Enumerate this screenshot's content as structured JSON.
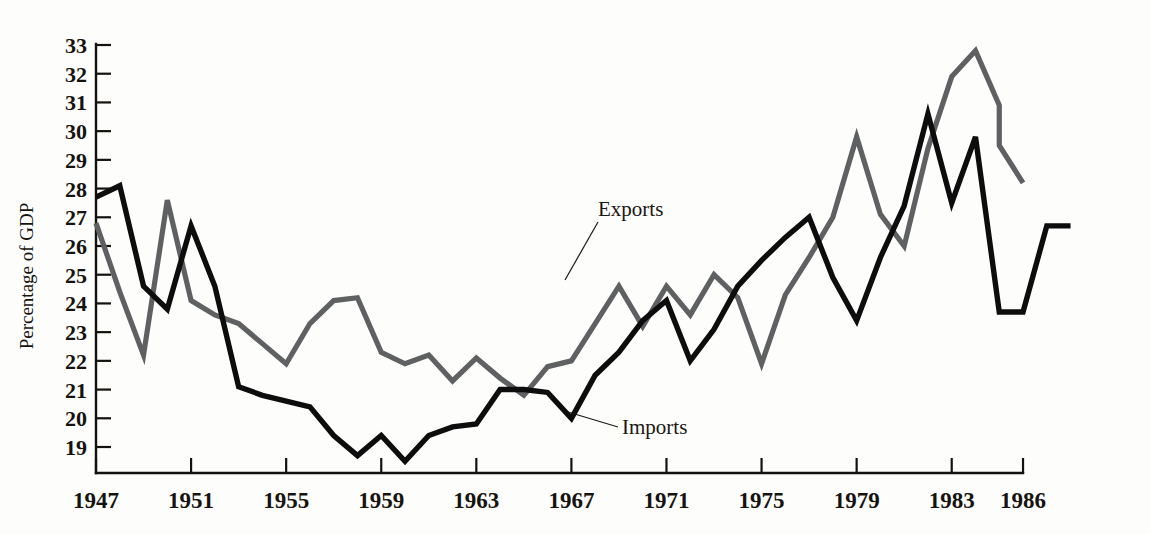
{
  "chart_data": {
    "type": "line",
    "title": "",
    "xlabel": "",
    "ylabel": "Percentage of GDP",
    "xlim": [
      1947,
      1986
    ],
    "ylim": [
      18.1,
      33
    ],
    "grid": false,
    "legend_position": "inline-annotations",
    "x_ticks": [
      1947,
      1951,
      1955,
      1959,
      1963,
      1967,
      1971,
      1975,
      1979,
      1983,
      1986
    ],
    "y_ticks": [
      19,
      20,
      21,
      22,
      23,
      24,
      25,
      26,
      27,
      28,
      29,
      30,
      31,
      32,
      33
    ],
    "x": [
      1947,
      1948,
      1949,
      1950,
      1951,
      1952,
      1953,
      1954,
      1955,
      1956,
      1957,
      1958,
      1959,
      1960,
      1961,
      1962,
      1963,
      1964,
      1965,
      1966,
      1967,
      1968,
      1969,
      1970,
      1971,
      1972,
      1973,
      1974,
      1975,
      1976,
      1977,
      1978,
      1979,
      1980,
      1981,
      1982,
      1983,
      1984,
      1985
    ],
    "series": [
      {
        "name": "Exports",
        "color": "#5f6062",
        "values": [
          26.8,
          24.4,
          22.2,
          27.6,
          24.1,
          23.6,
          23.3,
          22.6,
          21.9,
          23.3,
          24.1,
          24.2,
          22.3,
          21.9,
          22.2,
          21.3,
          22.1,
          21.4,
          20.8,
          21.8,
          22.0,
          23.3,
          24.6,
          23.2,
          24.6,
          23.6,
          25.0,
          24.2,
          21.9,
          24.3,
          25.6,
          27.0,
          29.8,
          27.1,
          26.0,
          29.4,
          31.9,
          32.8,
          30.9
        ]
      },
      {
        "name": "Imports",
        "color": "#0d0d0d",
        "values": [
          27.7,
          28.1,
          24.6,
          23.8,
          26.7,
          24.6,
          21.1,
          20.8,
          20.6,
          20.4,
          19.4,
          18.7,
          19.4,
          18.5,
          19.4,
          19.7,
          19.8,
          21.0,
          21.0,
          20.9,
          20.0,
          21.5,
          22.3,
          23.4,
          24.1,
          22.0,
          23.1,
          24.6,
          25.5,
          26.3,
          27.0,
          24.9,
          23.4,
          25.6,
          27.4,
          30.6,
          27.5,
          29.8,
          23.7
        ]
      }
    ],
    "extra_points": {
      "exports_tail": [
        [
          1985,
          29.5
        ],
        [
          1986,
          28.2
        ]
      ],
      "imports_tail": [
        [
          1986,
          23.7
        ],
        [
          1987,
          26.7
        ],
        [
          1988,
          26.7
        ]
      ]
    },
    "annotations": [
      {
        "label": "Exports",
        "x": 1967,
        "y": 26.0
      },
      {
        "label": "Imports",
        "x": 1969,
        "y": 19.7
      }
    ]
  },
  "axis": {
    "y_title": "Percentage of GDP"
  }
}
